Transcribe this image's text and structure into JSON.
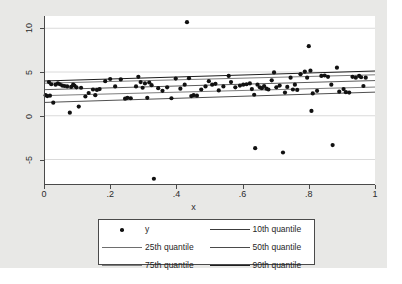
{
  "chart_data": {
    "type": "scatter",
    "title": "",
    "xlabel": "x",
    "ylabel": "",
    "xlim": [
      0,
      1
    ],
    "ylim": [
      -7.8,
      11.4
    ],
    "grid": "horizontal",
    "x_ticks": [
      "0",
      ".2",
      ".4",
      ".6",
      ".8",
      "1"
    ],
    "x_tick_values": [
      0,
      0.2,
      0.4,
      0.6,
      0.8,
      1
    ],
    "y_ticks": [
      "10",
      "5",
      "0",
      "-5"
    ],
    "y_tick_values": [
      10,
      5,
      0,
      -5
    ],
    "legend_position": "bottom",
    "legend_entries": [
      {
        "label": "y",
        "marker": "circle",
        "color": "#111111"
      },
      {
        "label": "10th quantile",
        "marker": "line",
        "color": "#3c3c3c"
      },
      {
        "label": "25th quantile",
        "marker": "line",
        "color": "#6e6e6e"
      },
      {
        "label": "50th quantile",
        "marker": "line",
        "color": "#4a4a4a"
      },
      {
        "label": "75th quantile",
        "marker": "line",
        "color": "#7b7b7b"
      },
      {
        "label": "90th quantile",
        "marker": "line",
        "color": "#1f1f1f"
      }
    ],
    "series": [
      {
        "name": "y",
        "type": "scatter",
        "points": [
          [
            0.005,
            2.35
          ],
          [
            0.01,
            2.25
          ],
          [
            0.015,
            3.85
          ],
          [
            0.018,
            2.3
          ],
          [
            0.022,
            3.6
          ],
          [
            0.028,
            1.5
          ],
          [
            0.035,
            3.55
          ],
          [
            0.042,
            3.7
          ],
          [
            0.048,
            3.6
          ],
          [
            0.055,
            3.45
          ],
          [
            0.062,
            3.4
          ],
          [
            0.07,
            3.35
          ],
          [
            0.078,
            0.35
          ],
          [
            0.082,
            3.3
          ],
          [
            0.088,
            3.55
          ],
          [
            0.092,
            3.45
          ],
          [
            0.098,
            3.25
          ],
          [
            0.105,
            1.05
          ],
          [
            0.112,
            3.2
          ],
          [
            0.125,
            2.2
          ],
          [
            0.135,
            2.6
          ],
          [
            0.148,
            3.0
          ],
          [
            0.155,
            2.35
          ],
          [
            0.16,
            2.95
          ],
          [
            0.168,
            3.05
          ],
          [
            0.185,
            3.95
          ],
          [
            0.2,
            4.2
          ],
          [
            0.215,
            3.35
          ],
          [
            0.232,
            4.15
          ],
          [
            0.245,
            1.95
          ],
          [
            0.252,
            2.05
          ],
          [
            0.262,
            2.0
          ],
          [
            0.278,
            3.35
          ],
          [
            0.285,
            4.45
          ],
          [
            0.292,
            3.85
          ],
          [
            0.298,
            3.2
          ],
          [
            0.305,
            3.7
          ],
          [
            0.312,
            2.05
          ],
          [
            0.318,
            3.8
          ],
          [
            0.325,
            3.5
          ],
          [
            0.332,
            -7.2
          ],
          [
            0.345,
            3.15
          ],
          [
            0.358,
            2.85
          ],
          [
            0.372,
            3.25
          ],
          [
            0.385,
            2.0
          ],
          [
            0.398,
            4.25
          ],
          [
            0.412,
            3.1
          ],
          [
            0.425,
            3.55
          ],
          [
            0.432,
            10.7
          ],
          [
            0.438,
            4.3
          ],
          [
            0.445,
            2.25
          ],
          [
            0.452,
            2.35
          ],
          [
            0.462,
            2.3
          ],
          [
            0.475,
            3.0
          ],
          [
            0.488,
            3.35
          ],
          [
            0.498,
            3.95
          ],
          [
            0.508,
            3.55
          ],
          [
            0.518,
            3.65
          ],
          [
            0.528,
            2.9
          ],
          [
            0.542,
            3.35
          ],
          [
            0.558,
            4.55
          ],
          [
            0.565,
            3.85
          ],
          [
            0.578,
            3.25
          ],
          [
            0.592,
            3.45
          ],
          [
            0.602,
            3.55
          ],
          [
            0.612,
            3.6
          ],
          [
            0.622,
            3.7
          ],
          [
            0.628,
            3.05
          ],
          [
            0.635,
            2.4
          ],
          [
            0.638,
            -3.7
          ],
          [
            0.645,
            3.55
          ],
          [
            0.652,
            3.25
          ],
          [
            0.658,
            3.15
          ],
          [
            0.665,
            3.4
          ],
          [
            0.672,
            3.1
          ],
          [
            0.678,
            3.0
          ],
          [
            0.688,
            4.05
          ],
          [
            0.695,
            4.95
          ],
          [
            0.702,
            3.25
          ],
          [
            0.712,
            3.45
          ],
          [
            0.722,
            -4.2
          ],
          [
            0.728,
            2.65
          ],
          [
            0.735,
            3.3
          ],
          [
            0.745,
            4.35
          ],
          [
            0.752,
            3.0
          ],
          [
            0.758,
            3.55
          ],
          [
            0.765,
            2.95
          ],
          [
            0.775,
            4.75
          ],
          [
            0.788,
            5.05
          ],
          [
            0.795,
            4.35
          ],
          [
            0.8,
            7.95
          ],
          [
            0.805,
            5.15
          ],
          [
            0.808,
            0.55
          ],
          [
            0.812,
            2.55
          ],
          [
            0.825,
            2.85
          ],
          [
            0.838,
            4.55
          ],
          [
            0.848,
            4.6
          ],
          [
            0.858,
            4.45
          ],
          [
            0.868,
            3.55
          ],
          [
            0.872,
            -3.35
          ],
          [
            0.885,
            5.5
          ],
          [
            0.892,
            2.75
          ],
          [
            0.905,
            3.05
          ],
          [
            0.912,
            2.7
          ],
          [
            0.922,
            2.65
          ],
          [
            0.932,
            4.45
          ],
          [
            0.942,
            4.35
          ],
          [
            0.952,
            4.55
          ],
          [
            0.958,
            4.4
          ],
          [
            0.965,
            3.4
          ],
          [
            0.972,
            4.35
          ]
        ]
      },
      {
        "name": "10th quantile",
        "type": "line",
        "color": "#3c3c3c",
        "width": 0.9,
        "x": [
          0,
          1
        ],
        "y": [
          1.52,
          2.7
        ]
      },
      {
        "name": "25th quantile",
        "type": "line",
        "color": "#6e6e6e",
        "width": 0.9,
        "x": [
          0,
          1
        ],
        "y": [
          2.3,
          3.28
        ]
      },
      {
        "name": "50th quantile",
        "type": "line",
        "color": "#4a4a4a",
        "width": 0.9,
        "x": [
          0,
          1
        ],
        "y": [
          2.98,
          4.02
        ]
      },
      {
        "name": "75th quantile",
        "type": "line",
        "color": "#7b7b7b",
        "width": 1.0,
        "x": [
          0,
          1
        ],
        "y": [
          3.72,
          4.68
        ]
      },
      {
        "name": "90th quantile",
        "type": "line",
        "color": "#1f1f1f",
        "width": 1.1,
        "x": [
          0,
          1
        ],
        "y": [
          3.98,
          5.12
        ]
      }
    ]
  },
  "colors": {
    "canvas_background": "#e8e8e6",
    "plot_background": "#ffffff",
    "axis": "#4a4a4a",
    "gridline": "#d0d0d0",
    "marker": "#111111",
    "text": "#2b2b2b"
  }
}
